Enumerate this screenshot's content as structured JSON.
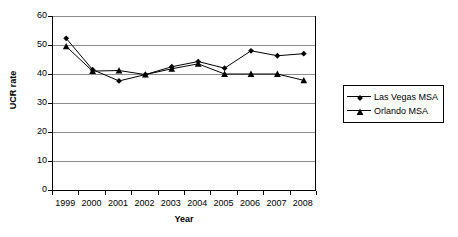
{
  "chart_data": {
    "type": "line",
    "title": "",
    "xlabel": "Year",
    "ylabel": "UCR rate",
    "categories": [
      "1999",
      "2000",
      "2001",
      "2002",
      "2003",
      "2004",
      "2005",
      "2006",
      "2007",
      "2008"
    ],
    "ylim": [
      0,
      60
    ],
    "yticks": [
      0,
      10,
      20,
      30,
      40,
      50,
      60
    ],
    "ytick_labels": [
      "0",
      "10",
      "20",
      "30",
      "40",
      "50",
      "60"
    ],
    "grid": true,
    "legend_position": "right",
    "series": [
      {
        "name": "Las Vegas MSA",
        "marker": "diamond",
        "color": "#000000",
        "values": [
          52.3,
          41.5,
          37.6,
          39.8,
          42.5,
          44.3,
          42.0,
          48.0,
          46.3,
          47.0
        ]
      },
      {
        "name": "Orlando MSA",
        "marker": "triangle",
        "color": "#000000",
        "values": [
          49.5,
          41.0,
          41.2,
          39.8,
          41.8,
          43.5,
          40.0,
          40.0,
          40.0,
          37.8
        ]
      }
    ]
  },
  "legend": {
    "entries": [
      {
        "label": "Las Vegas MSA",
        "marker": "diamond"
      },
      {
        "label": "Orlando MSA",
        "marker": "triangle"
      }
    ]
  },
  "axes": {
    "y_title": "UCR rate",
    "x_title": "Year"
  }
}
